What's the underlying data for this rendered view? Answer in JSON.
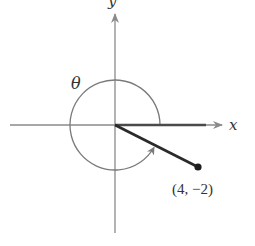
{
  "diagram": {
    "axes": {
      "x_label": "x",
      "y_label": "y"
    },
    "angle": {
      "label": "θ",
      "direction": "counterclockwise",
      "description": "Reflex angle from positive x-axis to terminal side in quadrant IV"
    },
    "point": {
      "x": 4,
      "y": -2,
      "label": "(4, −2)"
    },
    "colors": {
      "axis": "#8a8a8a",
      "arc": "#7a7a7a",
      "ray": "#2a2a2a"
    }
  }
}
